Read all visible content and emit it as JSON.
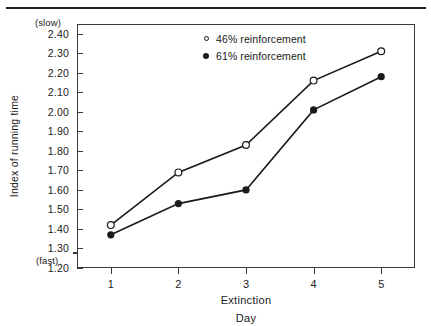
{
  "chart_data": {
    "type": "line",
    "title": "",
    "xlabel": "Extinction Day",
    "xlabel_line1": "Extinction",
    "xlabel_line2": "Day",
    "ylabel": "Index of running time",
    "y_top_annotation": "(slow)",
    "y_bottom_annotation": "(fast)",
    "x": [
      1,
      2,
      3,
      4,
      5
    ],
    "categories": [
      "1",
      "2",
      "3",
      "4",
      "5"
    ],
    "xlim": [
      0.5,
      5.5
    ],
    "ylim": [
      1.2,
      2.45
    ],
    "yticks": [
      1.2,
      1.3,
      1.4,
      1.5,
      1.6,
      1.7,
      1.8,
      1.9,
      2.0,
      2.1,
      2.2,
      2.3,
      2.4
    ],
    "ytick_labels": [
      "1.20",
      "1.30",
      "1.40",
      "1.50",
      "1.60",
      "1.70",
      "1.80",
      "1.90",
      "2.00",
      "2.10",
      "2.20",
      "2.30",
      "2.40"
    ],
    "grid": false,
    "axis_break": true,
    "legend_position": "top-center",
    "series": [
      {
        "name": "46% reinforcement",
        "marker": "open-circle",
        "values": [
          1.42,
          1.69,
          1.83,
          2.16,
          2.31
        ]
      },
      {
        "name": "61% reinforcement",
        "marker": "filled-circle",
        "values": [
          1.37,
          1.53,
          1.6,
          2.01,
          2.18
        ]
      }
    ]
  },
  "legend": {
    "items": [
      {
        "label": "46% reinforcement",
        "marker": "open-circle"
      },
      {
        "label": "61% reinforcement",
        "marker": "filled-circle"
      }
    ]
  },
  "colors": {
    "line": "#1a1a1a",
    "frame": "#3a3a3a",
    "background": "#ffffff"
  }
}
